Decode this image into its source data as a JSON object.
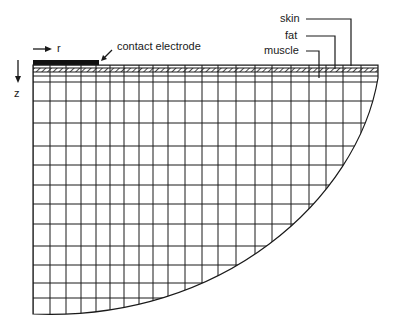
{
  "diagram": {
    "type": "finite-element mesh cross-section",
    "axes": {
      "r_label": "r",
      "z_label": "z"
    },
    "labels": {
      "electrode": "contact electrode",
      "skin": "skin",
      "fat": "fat",
      "muscle": "muscle"
    },
    "layers": [
      "skin",
      "fat",
      "muscle"
    ],
    "colors": {
      "line": "#1a1a1a",
      "background": "#ffffff"
    },
    "mesh": {
      "left_x": 33,
      "right_x": 378,
      "top_y": 65,
      "vertical_lines_x": [
        33,
        50,
        66,
        81,
        96,
        110,
        124,
        139,
        153,
        168,
        185,
        202,
        218,
        236,
        255,
        272,
        291,
        309,
        326,
        343,
        361
      ],
      "horizontal_lines_y": [
        82,
        101,
        123,
        146,
        165,
        185,
        204,
        224,
        246,
        265,
        283,
        298
      ],
      "bottom_y": 314
    }
  }
}
